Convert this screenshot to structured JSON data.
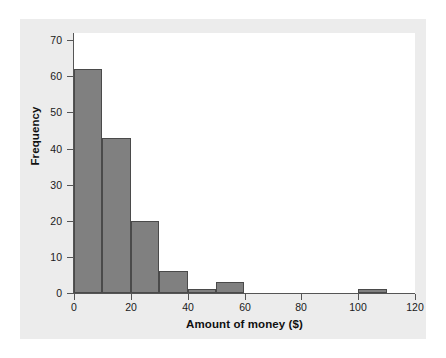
{
  "chart_data": {
    "type": "bar",
    "chart_subtype": "histogram",
    "title": "",
    "xlabel": "Amount of money ($)",
    "ylabel": "Frequency",
    "xlim": [
      0,
      120
    ],
    "ylim": [
      0,
      72
    ],
    "bin_width": 10,
    "grid": false,
    "legend": false,
    "bar_color": "#808080",
    "bar_edge_color": "#4a4a4a",
    "plot_background": "#ffffff",
    "panel_background": "#ececec",
    "axis_color": "#555555",
    "xticks": [
      0,
      20,
      40,
      60,
      80,
      100,
      120
    ],
    "xtick_labels": [
      "0",
      "20",
      "40",
      "60",
      "80",
      "100",
      "120"
    ],
    "yticks": [
      0,
      10,
      20,
      30,
      40,
      50,
      60,
      70
    ],
    "ytick_labels": [
      "0",
      "10",
      "20",
      "30",
      "40",
      "50",
      "60",
      "70"
    ],
    "bins": [
      {
        "start": 0,
        "end": 10,
        "value": 62
      },
      {
        "start": 10,
        "end": 20,
        "value": 43
      },
      {
        "start": 20,
        "end": 30,
        "value": 20
      },
      {
        "start": 30,
        "end": 40,
        "value": 6
      },
      {
        "start": 40,
        "end": 50,
        "value": 1
      },
      {
        "start": 50,
        "end": 60,
        "value": 3
      },
      {
        "start": 60,
        "end": 70,
        "value": 0
      },
      {
        "start": 70,
        "end": 80,
        "value": 0
      },
      {
        "start": 80,
        "end": 90,
        "value": 0
      },
      {
        "start": 90,
        "end": 100,
        "value": 0
      },
      {
        "start": 100,
        "end": 110,
        "value": 1
      },
      {
        "start": 110,
        "end": 120,
        "value": 0
      }
    ],
    "categories": [
      "0-10",
      "10-20",
      "20-30",
      "30-40",
      "40-50",
      "50-60",
      "60-70",
      "70-80",
      "80-90",
      "90-100",
      "100-110",
      "110-120"
    ],
    "values": [
      62,
      43,
      20,
      6,
      1,
      3,
      0,
      0,
      0,
      0,
      1,
      0
    ]
  }
}
